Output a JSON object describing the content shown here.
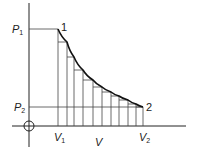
{
  "diagram": {
    "axes": {
      "x_label": "V",
      "origin_symbol": "circled-cross"
    },
    "labels": {
      "p1": "P",
      "p1_sub": "1",
      "p2": "P",
      "p2_sub": "2",
      "v1": "V",
      "v1_sub": "1",
      "v2": "V",
      "v2_sub": "2",
      "point1": "1",
      "point2": "2"
    },
    "colors": {
      "line": "#222222",
      "curve": "#111111",
      "background": "#ffffff"
    },
    "strips": {
      "count": 10,
      "x_positions": [
        58,
        67,
        74,
        83,
        93,
        102,
        111,
        119,
        128,
        136,
        143
      ],
      "curve_y": [
        29,
        42,
        57,
        70,
        80,
        87,
        92,
        96,
        100,
        104,
        107
      ]
    }
  }
}
